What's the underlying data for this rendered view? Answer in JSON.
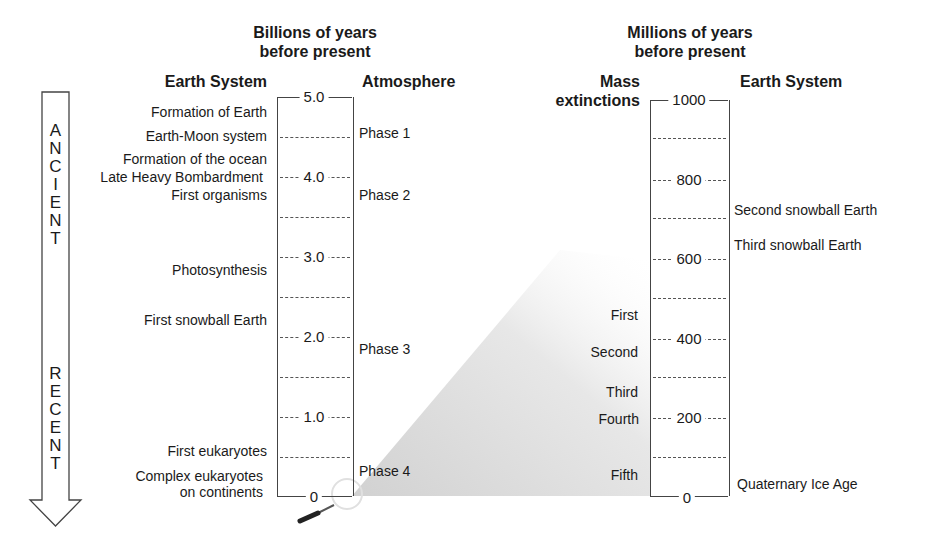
{
  "left_panel": {
    "title": [
      "Billions of years",
      "before present"
    ],
    "col_left_header": "Earth System",
    "col_right_header": "Atmosphere",
    "ticks": [
      "5.0",
      "4.0",
      "3.0",
      "2.0",
      "1.0",
      "0"
    ],
    "earth_system_events": [
      "Formation of Earth",
      "Earth-Moon system",
      "Formation of the ocean",
      "Late Heavy Bombardment",
      "First organisms",
      "Photosynthesis",
      "First snowball Earth",
      "First eukaryotes",
      "Complex eukaryotes",
      "on continents"
    ],
    "atmosphere_phases": [
      "Phase 1",
      "Phase 2",
      "Phase 3",
      "Phase 4"
    ]
  },
  "right_panel": {
    "title": [
      "Millions of years",
      "before present"
    ],
    "col_left_header": [
      "Mass",
      "extinctions"
    ],
    "col_right_header": "Earth System",
    "ticks": [
      "1000",
      "800",
      "600",
      "400",
      "200",
      "0"
    ],
    "mass_extinctions": [
      "First",
      "Second",
      "Third",
      "Fourth",
      "Fifth"
    ],
    "earth_system_events": [
      "Second snowball Earth",
      "Third snowball Earth",
      "Quaternary Ice Age"
    ]
  },
  "arrow": {
    "top_word": [
      "A",
      "N",
      "C",
      "I",
      "E",
      "N",
      "T"
    ],
    "bottom_word": [
      "R",
      "E",
      "C",
      "E",
      "N",
      "T"
    ]
  },
  "colors": {
    "line": "#444444",
    "text": "#1a1a1a",
    "wedge": "#d9d9d9"
  }
}
